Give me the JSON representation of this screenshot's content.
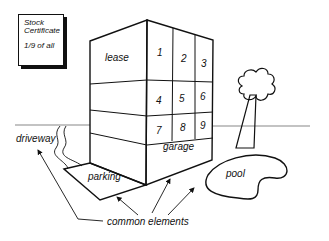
{
  "certificate": {
    "line1": "Stock",
    "line2": "Certificate",
    "fraction": "1/9 of all"
  },
  "building": {
    "lease_label": "lease",
    "garage_label": "garage",
    "units": [
      "1",
      "2",
      "3",
      "4",
      "5",
      "6",
      "7",
      "8",
      "9"
    ]
  },
  "labels": {
    "driveway": "driveway",
    "parking": "parking",
    "pool": "pool",
    "common_elements": "common elements"
  }
}
